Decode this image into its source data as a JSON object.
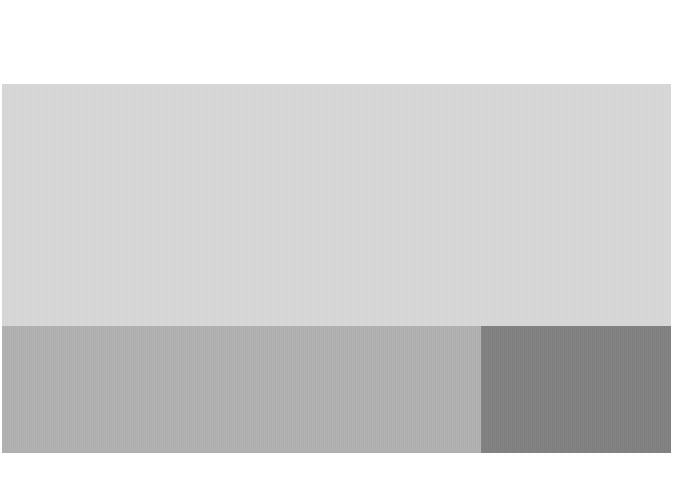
{
  "canvas": {
    "width": 674,
    "height": 486,
    "background_color": "#ffffff",
    "description": "Abstract flat gray block layout"
  },
  "regions": {
    "top_margin": {
      "name": "top-margin",
      "color": "#ffffff",
      "x": 0,
      "y": 0,
      "width": 674,
      "height": 84,
      "label": ""
    },
    "header_panel": {
      "name": "header-panel",
      "color": "#d7d7d7",
      "x": 2,
      "y": 84,
      "width": 669,
      "height": 242,
      "label": ""
    },
    "footer_band": {
      "name": "footer-band",
      "color": "#b0b0b0",
      "x": 2,
      "y": 326,
      "width": 479,
      "height": 127,
      "label": ""
    },
    "footer_accent": {
      "name": "footer-accent",
      "color": "#808080",
      "x": 481,
      "y": 326,
      "width": 190,
      "height": 127,
      "label": ""
    },
    "bottom_margin": {
      "name": "bottom-margin",
      "color": "#ffffff",
      "x": 0,
      "y": 453,
      "width": 674,
      "height": 33,
      "label": ""
    }
  },
  "palette": {
    "background": "#ffffff",
    "light_gray": "#d7d7d7",
    "medium_gray": "#b0b0b0",
    "dark_gray": "#808080"
  }
}
